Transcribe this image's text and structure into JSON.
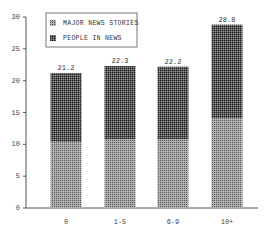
{
  "chart_data": {
    "type": "bar",
    "stacked": true,
    "title": "",
    "xlabel": "",
    "ylabel": "",
    "categories": [
      "0",
      "1-5",
      "6-9",
      "10+"
    ],
    "series": [
      {
        "name": "MAJOR NEWS STORIES",
        "values": [
          10.4,
          10.8,
          10.8,
          14.1
        ],
        "color": "#8a8a8a"
      },
      {
        "name": "PEOPLE IN NEWS",
        "values": [
          10.8,
          11.5,
          11.4,
          14.7
        ],
        "color": "#3a3a3a"
      }
    ],
    "totals": [
      "21.2",
      "22.3",
      "22.2",
      "28.8"
    ],
    "ylim": [
      0,
      30
    ],
    "yticks": [
      "0",
      "5",
      "10",
      "15",
      "20",
      "25",
      "30"
    ],
    "grid": false,
    "legend_position": "top-left inside"
  },
  "legend": {
    "items": [
      "MAJOR NEWS STORIES",
      "PEOPLE IN NEWS"
    ]
  }
}
